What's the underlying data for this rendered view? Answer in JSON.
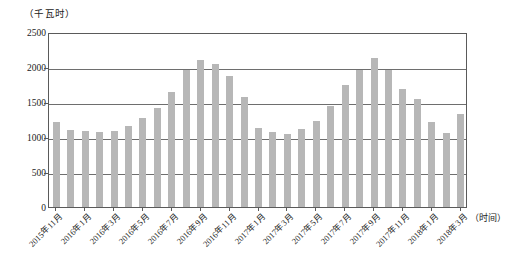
{
  "chart_data": {
    "type": "bar",
    "title": "",
    "subtitle": "",
    "xlabel": "（时间）",
    "ylabel": "（千瓦时）",
    "ylim": [
      0,
      2500
    ],
    "ytick_values": [
      0,
      500,
      1000,
      1500,
      2000,
      2500
    ],
    "ytick_labels": [
      "0",
      "500",
      "1000",
      "1500",
      "2000",
      "2500"
    ],
    "grid": true,
    "legend": "none",
    "bar_color": "#b7b7b7",
    "axis_color": "#5a5a5a",
    "categories": [
      "2015年11月",
      "2015年12月",
      "2016年1月",
      "2016年2月",
      "2016年3月",
      "2016年4月",
      "2016年5月",
      "2016年6月",
      "2016年7月",
      "2016年8月",
      "2016年9月",
      "2016年10月",
      "2016年11月",
      "2016年12月",
      "2017年1月",
      "2017年2月",
      "2017年3月",
      "2017年4月",
      "2017年5月",
      "2017年6月",
      "2017年7月",
      "2017年8月",
      "2017年9月",
      "2017年10月",
      "2017年11月",
      "2017年12月",
      "2018年1月",
      "2018年2月",
      "2018年3月"
    ],
    "values": [
      1215,
      1105,
      1090,
      1065,
      1080,
      1160,
      1270,
      1415,
      1640,
      1955,
      2105,
      2050,
      1870,
      1570,
      1135,
      1075,
      1050,
      1120,
      1235,
      1440,
      1740,
      1955,
      2125,
      1960,
      1680,
      1540,
      1215,
      1060,
      1330
    ],
    "xtick_labels": [
      "2015年11月",
      "2016年1月",
      "2016年3月",
      "2016年5月",
      "2016年7月",
      "2016年9月",
      "2016年11月",
      "2017年1月",
      "2017年3月",
      "2017年5月",
      "2017年7月",
      "2017年9月",
      "2017年11月",
      "2018年1月",
      "2018年3月"
    ],
    "xtick_indices": [
      0,
      2,
      4,
      6,
      8,
      10,
      12,
      14,
      16,
      18,
      20,
      22,
      24,
      26,
      28
    ]
  }
}
